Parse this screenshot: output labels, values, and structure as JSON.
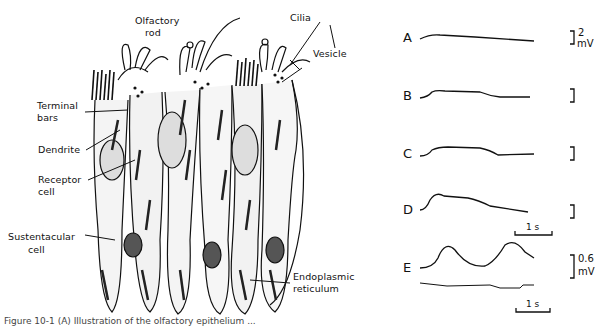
{
  "figure": {
    "type": "scientific illustration",
    "left_panel": {
      "title": "Olfactory epithelium (histology drawing)",
      "labels": {
        "olfactory_rod": "Olfactory\nrod",
        "olfactory_rod_l1": "Olfactory",
        "olfactory_rod_l2": "rod",
        "cilia": "Cilia",
        "vesicle": "Vesicle",
        "terminal_bars_l1": "Terminal",
        "terminal_bars_l2": "bars",
        "dendrite": "Dendrite",
        "receptor_cell_l1": "Receptor",
        "receptor_cell_l2": "cell",
        "sustentacular_cell_l1": "Sustentacular",
        "sustentacular_cell_l2": "cell",
        "endoplasmic_reticulum_l1": "Endoplasmic",
        "endoplasmic_reticulum_l2": "reticulum"
      }
    },
    "right_panel": {
      "title": "Electro-olfactogram traces",
      "traces": [
        {
          "label": "A",
          "scale": "2 mV",
          "scale_value": "2",
          "scale_unit": "mV",
          "shape": "small step, slow decay"
        },
        {
          "label": "B",
          "scale": "",
          "shape": "step plateau then decline"
        },
        {
          "label": "C",
          "scale": "",
          "shape": "larger plateau then decline"
        },
        {
          "label": "D",
          "scale": "",
          "shape": "peak then slow decline",
          "time_bar": "1 s"
        },
        {
          "label": "E",
          "scale": "0.6 mV",
          "scale_value": "0.6",
          "scale_unit": "mV",
          "shape": "two peaks with stimulus marker",
          "time_bar": "1 s"
        }
      ],
      "time_bar_label": "1 s"
    },
    "caption": "Figure 10-1 (A) Illustration of the olfactory epithelium ..."
  }
}
